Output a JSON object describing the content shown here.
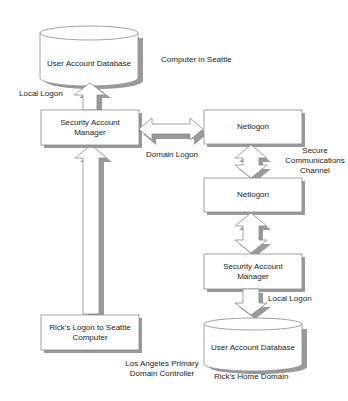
{
  "diagram": {
    "nodes": {
      "seattle_db": "User Account Database",
      "seattle_sam": [
        "Security Account",
        "Manager"
      ],
      "netlogon_seattle": "Netlogon",
      "netlogon_la": "Netlogon",
      "la_sam": [
        "Security Account",
        "Manager"
      ],
      "la_db": "User Account Database",
      "ricks_logon": [
        "Rick's Logon to Seattle",
        "Computer"
      ]
    },
    "labels": {
      "computer_in_seattle": "Computer in Seattle",
      "local_logon_top": "Local Logon",
      "domain_logon": "Domain Logon",
      "secure_channel": [
        "Secure",
        "Communications",
        "Channel"
      ],
      "local_logon_bottom": "Local Logon",
      "la_pdc": [
        "Los Angeles Primary",
        "Domain Controller"
      ],
      "ricks_home_domain": "Rick's  Home Domain"
    },
    "edges": [
      {
        "from": "ricks_logon",
        "to": "seattle_sam",
        "type": "arrow-up"
      },
      {
        "from": "seattle_sam",
        "to": "seattle_db",
        "type": "arrow-up",
        "label": "Local Logon"
      },
      {
        "from": "seattle_sam",
        "to": "netlogon_seattle",
        "type": "double-arrow",
        "label": "Domain Logon"
      },
      {
        "from": "netlogon_seattle",
        "to": "netlogon_la",
        "type": "double-arrow",
        "label": "Secure Communications Channel"
      },
      {
        "from": "netlogon_la",
        "to": "la_sam",
        "type": "double-arrow"
      },
      {
        "from": "la_sam",
        "to": "la_db",
        "type": "arrow-down",
        "label": "Local Logon"
      }
    ],
    "colors": {
      "stroke": "#8a8a8a",
      "shadow": "#9a9a9a",
      "fill": "#ffffff",
      "text": "#222222"
    }
  }
}
